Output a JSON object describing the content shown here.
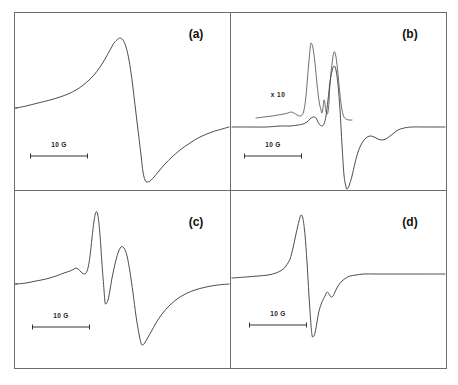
{
  "figure": {
    "background_color": "#ffffff",
    "frame_color": "#6c6c6c",
    "trace_color": "#3a3a3a",
    "width": 458,
    "height": 385,
    "frame": {
      "x": 14,
      "y": 12,
      "w": 432,
      "h": 356
    },
    "divider_x": 230,
    "divider_y": 190
  },
  "chart_data": {
    "type": "line",
    "title": "",
    "xlabel": "",
    "ylabel": "",
    "grid": false,
    "legend_position": "none",
    "panel_count": 4,
    "common_scalebar": "10 G",
    "panels": [
      {
        "id": "a",
        "label": "(a)",
        "label_pos": {
          "x": 196,
          "y": 38
        },
        "bounds": {
          "x": 14,
          "y": 12,
          "w": 216,
          "h": 178
        },
        "baseline_y": 108,
        "scalebar": {
          "label": "10 G",
          "x1": 30,
          "x2": 88,
          "y": 156,
          "label_x": 59,
          "label_y": 147
        },
        "description": "Broad single derivative line, slowly rising shoulder, sharp peak then deep trough with slow recovery",
        "features": [
          {
            "name": "peak",
            "x": 120,
            "y": 38
          },
          {
            "name": "trough",
            "x": 143,
            "y": 182
          },
          {
            "name": "left-baseline",
            "x": 16,
            "y": 108
          },
          {
            "name": "right-tail",
            "x": 229,
            "y": 127
          }
        ],
        "points": [
          [
            16,
            108
          ],
          [
            26,
            106
          ],
          [
            38,
            103
          ],
          [
            50,
            100
          ],
          [
            60,
            97
          ],
          [
            68,
            94
          ],
          [
            76,
            90
          ],
          [
            82,
            86
          ],
          [
            88,
            81
          ],
          [
            94,
            75
          ],
          [
            100,
            67
          ],
          [
            105,
            59
          ],
          [
            110,
            50
          ],
          [
            114,
            43
          ],
          [
            118,
            39
          ],
          [
            120,
            38
          ],
          [
            123,
            40
          ],
          [
            126,
            47
          ],
          [
            129,
            60
          ],
          [
            132,
            80
          ],
          [
            135,
            105
          ],
          [
            138,
            130
          ],
          [
            141,
            155
          ],
          [
            143,
            172
          ],
          [
            145,
            180
          ],
          [
            147,
            182
          ],
          [
            150,
            181
          ],
          [
            154,
            177
          ],
          [
            159,
            171
          ],
          [
            165,
            164
          ],
          [
            172,
            157
          ],
          [
            180,
            150
          ],
          [
            190,
            143
          ],
          [
            200,
            137
          ],
          [
            212,
            132
          ],
          [
            222,
            129
          ],
          [
            229,
            127
          ]
        ]
      },
      {
        "id": "b",
        "label": "(b)",
        "label_pos": {
          "x": 410,
          "y": 38
        },
        "bounds": {
          "x": 230,
          "y": 12,
          "w": 216,
          "h": 178
        },
        "baseline_y": 127,
        "multiplier_label": "x 10",
        "multiplier_pos": {
          "x": 278,
          "y": 97
        },
        "scalebar": {
          "label": "10 G",
          "x1": 244,
          "x2": 302,
          "y": 156,
          "label_x": 273,
          "label_y": 147
        },
        "description": "Main trace with narrow intense derivative line plus a ten-times amplified overlay trace showing two sharp resolved peaks",
        "features": [
          {
            "name": "x10-peak-1",
            "x": 311,
            "y": 43
          },
          {
            "name": "x10-peak-2",
            "x": 334,
            "y": 52
          },
          {
            "name": "main-peak",
            "x": 334,
            "y": 66
          },
          {
            "name": "main-trough",
            "x": 344,
            "y": 189
          }
        ],
        "points_main": [
          [
            232,
            127
          ],
          [
            250,
            127
          ],
          [
            266,
            127
          ],
          [
            280,
            126
          ],
          [
            290,
            126
          ],
          [
            298,
            125
          ],
          [
            303,
            124
          ],
          [
            307,
            122
          ],
          [
            310,
            119
          ],
          [
            313,
            117
          ],
          [
            316,
            118
          ],
          [
            318,
            122
          ],
          [
            320,
            125
          ],
          [
            322,
            126
          ],
          [
            324,
            124
          ],
          [
            326,
            116
          ],
          [
            328,
            100
          ],
          [
            330,
            82
          ],
          [
            332,
            71
          ],
          [
            334,
            66
          ],
          [
            336,
            70
          ],
          [
            338,
            85
          ],
          [
            340,
            110
          ],
          [
            342,
            145
          ],
          [
            344,
            175
          ],
          [
            346,
            187
          ],
          [
            347,
            189
          ],
          [
            349,
            186
          ],
          [
            352,
            176
          ],
          [
            355,
            163
          ],
          [
            358,
            152
          ],
          [
            362,
            143
          ],
          [
            366,
            138
          ],
          [
            370,
            136
          ],
          [
            374,
            137
          ],
          [
            378,
            139
          ],
          [
            382,
            140
          ],
          [
            386,
            139
          ],
          [
            390,
            136
          ],
          [
            394,
            133
          ],
          [
            398,
            130
          ],
          [
            404,
            128
          ],
          [
            412,
            127
          ],
          [
            424,
            127
          ],
          [
            438,
            127
          ],
          [
            445,
            127
          ]
        ],
        "points_x10": [
          [
            256,
            118
          ],
          [
            264,
            117
          ],
          [
            272,
            116
          ],
          [
            278,
            115
          ],
          [
            284,
            114
          ],
          [
            288,
            113
          ],
          [
            291,
            112
          ],
          [
            294,
            113
          ],
          [
            297,
            115
          ],
          [
            300,
            116
          ],
          [
            302,
            115
          ],
          [
            304,
            110
          ],
          [
            306,
            96
          ],
          [
            308,
            72
          ],
          [
            310,
            50
          ],
          [
            311,
            43
          ],
          [
            313,
            48
          ],
          [
            315,
            63
          ],
          [
            317,
            84
          ],
          [
            319,
            101
          ],
          [
            321,
            110
          ],
          [
            322,
            113
          ],
          [
            323,
            108
          ],
          [
            324,
            100
          ],
          [
            325,
            104
          ],
          [
            326,
            111
          ],
          [
            327,
            114
          ],
          [
            328,
            112
          ],
          [
            329,
            102
          ],
          [
            330,
            84
          ],
          [
            332,
            64
          ],
          [
            334,
            52
          ],
          [
            336,
            57
          ],
          [
            338,
            74
          ],
          [
            340,
            95
          ],
          [
            342,
            110
          ],
          [
            344,
            117
          ],
          [
            346,
            119
          ],
          [
            349,
            120
          ],
          [
            352,
            120
          ]
        ]
      },
      {
        "id": "c",
        "label": "(c)",
        "label_pos": {
          "x": 196,
          "y": 226
        },
        "bounds": {
          "x": 14,
          "y": 190,
          "w": 216,
          "h": 178
        },
        "baseline_y": 284,
        "scalebar": {
          "label": "10 G",
          "x1": 32,
          "x2": 90,
          "y": 327,
          "label_x": 61,
          "label_y": 318
        },
        "description": "Resolved hyperfine pattern: small shoulder bump, tall sharp peak, intermediate minimum, broad second peak, deep trough and slow recovery",
        "features": [
          {
            "name": "shoulder-bump",
            "x": 76,
            "y": 268
          },
          {
            "name": "main-peak",
            "x": 96,
            "y": 212
          },
          {
            "name": "inter-minimum",
            "x": 105,
            "y": 304
          },
          {
            "name": "second-peak",
            "x": 121,
            "y": 247
          },
          {
            "name": "trough",
            "x": 142,
            "y": 345
          }
        ],
        "points": [
          [
            16,
            284
          ],
          [
            26,
            283
          ],
          [
            36,
            281
          ],
          [
            46,
            279
          ],
          [
            56,
            276
          ],
          [
            64,
            273
          ],
          [
            70,
            271
          ],
          [
            74,
            269
          ],
          [
            76,
            268
          ],
          [
            78,
            269
          ],
          [
            81,
            272
          ],
          [
            84,
            274
          ],
          [
            86,
            273
          ],
          [
            88,
            268
          ],
          [
            90,
            256
          ],
          [
            92,
            238
          ],
          [
            94,
            221
          ],
          [
            96,
            212
          ],
          [
            98,
            216
          ],
          [
            100,
            235
          ],
          [
            102,
            264
          ],
          [
            104,
            290
          ],
          [
            105,
            302
          ],
          [
            106,
            304
          ],
          [
            108,
            300
          ],
          [
            110,
            290
          ],
          [
            112,
            278
          ],
          [
            115,
            264
          ],
          [
            118,
            253
          ],
          [
            121,
            247
          ],
          [
            124,
            248
          ],
          [
            127,
            256
          ],
          [
            130,
            272
          ],
          [
            133,
            293
          ],
          [
            136,
            316
          ],
          [
            139,
            334
          ],
          [
            141,
            343
          ],
          [
            142,
            345
          ],
          [
            144,
            344
          ],
          [
            147,
            339
          ],
          [
            151,
            332
          ],
          [
            156,
            323
          ],
          [
            162,
            314
          ],
          [
            170,
            305
          ],
          [
            180,
            297
          ],
          [
            192,
            291
          ],
          [
            206,
            287
          ],
          [
            218,
            285
          ],
          [
            229,
            284
          ]
        ]
      },
      {
        "id": "d",
        "label": "(d)",
        "label_pos": {
          "x": 410,
          "y": 226
        },
        "bounds": {
          "x": 230,
          "y": 190,
          "w": 216,
          "h": 178
        },
        "baseline_y": 278,
        "scalebar": {
          "label": "10 G",
          "x1": 249,
          "x2": 307,
          "y": 325,
          "label_x": 278,
          "label_y": 316
        },
        "description": "Asymmetric narrow derivative line with sharp peak, deep narrow trough and small resolved wiggles on the recovery side",
        "features": [
          {
            "name": "peak",
            "x": 301,
            "y": 215
          },
          {
            "name": "trough",
            "x": 312,
            "y": 337
          },
          {
            "name": "wiggle-1",
            "x": 328,
            "y": 292
          },
          {
            "name": "wiggle-2",
            "x": 334,
            "y": 295
          }
        ],
        "points": [
          [
            232,
            278
          ],
          [
            246,
            277
          ],
          [
            258,
            276
          ],
          [
            268,
            275
          ],
          [
            276,
            273
          ],
          [
            282,
            270
          ],
          [
            286,
            266
          ],
          [
            290,
            259
          ],
          [
            293,
            248
          ],
          [
            296,
            234
          ],
          [
            299,
            221
          ],
          [
            301,
            215
          ],
          [
            303,
            219
          ],
          [
            305,
            235
          ],
          [
            307,
            262
          ],
          [
            309,
            296
          ],
          [
            311,
            325
          ],
          [
            312,
            335
          ],
          [
            313,
            337
          ],
          [
            315,
            333
          ],
          [
            317,
            322
          ],
          [
            319,
            311
          ],
          [
            322,
            302
          ],
          [
            325,
            296
          ],
          [
            327,
            292
          ],
          [
            329,
            294
          ],
          [
            331,
            297
          ],
          [
            333,
            296
          ],
          [
            335,
            292
          ],
          [
            338,
            286
          ],
          [
            342,
            281
          ],
          [
            346,
            278
          ],
          [
            350,
            276
          ],
          [
            356,
            275
          ],
          [
            364,
            274
          ],
          [
            374,
            274
          ],
          [
            386,
            274
          ],
          [
            400,
            274
          ],
          [
            416,
            274
          ],
          [
            432,
            274
          ],
          [
            445,
            274
          ]
        ]
      }
    ]
  }
}
